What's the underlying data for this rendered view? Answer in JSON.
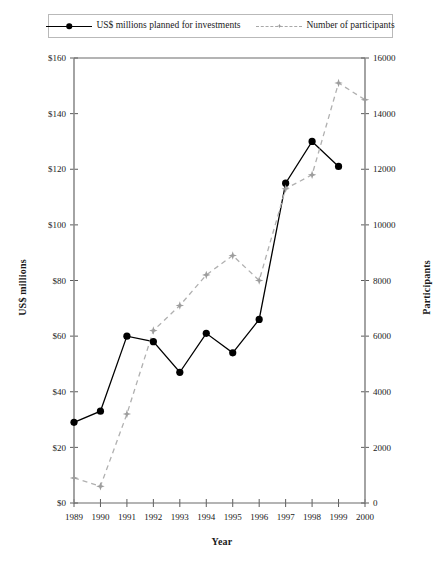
{
  "legend": {
    "entries": [
      {
        "label": "US$ millions planned for investments",
        "marker": "filled-circle-icon",
        "style": "solid",
        "color": "#000000"
      },
      {
        "label": "Number of participants",
        "marker": "star-marker-icon",
        "style": "dashed",
        "color": "#9d9d9d"
      }
    ]
  },
  "axes": {
    "x_title": "Year",
    "y_left_title": "US$ millions",
    "y_right_title": "Participants"
  },
  "chart_data": {
    "type": "line",
    "title": "",
    "subtitle": "",
    "xlabel": "Year",
    "ylabel": "US$ millions",
    "y2label": "Participants",
    "grid": false,
    "legend_position": "top",
    "categories": [
      "1989",
      "1990",
      "1991",
      "1992",
      "1993",
      "1994",
      "1995",
      "1996",
      "1997",
      "1998",
      "1999",
      "2000"
    ],
    "xtick_labels": [
      "1989",
      "1990",
      "1991",
      "1992",
      "1993",
      "1994",
      "1995",
      "1996",
      "1997",
      "1998",
      "1999",
      "2000"
    ],
    "ylim": [
      0,
      160
    ],
    "ytick_labels": [
      "$0",
      "$20",
      "$40",
      "$60",
      "$80",
      "$100",
      "$120",
      "$140",
      "$160"
    ],
    "ytick_values": [
      0,
      20,
      40,
      60,
      80,
      100,
      120,
      140,
      160
    ],
    "y2lim": [
      0,
      16000
    ],
    "y2tick_labels": [
      "0",
      "2000",
      "4000",
      "6000",
      "8000",
      "10000",
      "12000",
      "14000",
      "16000"
    ],
    "y2tick_values": [
      0,
      2000,
      4000,
      6000,
      8000,
      10000,
      12000,
      14000,
      16000
    ],
    "series": [
      {
        "name": "US$ millions planned for investments",
        "axis": "left",
        "style": "solid",
        "color": "#000000",
        "marker": "filled-circle",
        "x": [
          "1989",
          "1990",
          "1991",
          "1992",
          "1993",
          "1994",
          "1995",
          "1996",
          "1997",
          "1998",
          "1999"
        ],
        "values": [
          29,
          33,
          60,
          58,
          47,
          61,
          54,
          66,
          115,
          130,
          121
        ]
      },
      {
        "name": "Number of participants",
        "axis": "right",
        "style": "dashed",
        "color": "#9d9d9d",
        "marker": "star",
        "x": [
          "1989",
          "1990",
          "1991",
          "1992",
          "1993",
          "1994",
          "1995",
          "1996",
          "1997",
          "1998",
          "1999",
          "2000"
        ],
        "values": [
          900,
          600,
          3200,
          6200,
          7100,
          8200,
          8900,
          8000,
          11300,
          11800,
          15100,
          14500
        ]
      }
    ]
  }
}
